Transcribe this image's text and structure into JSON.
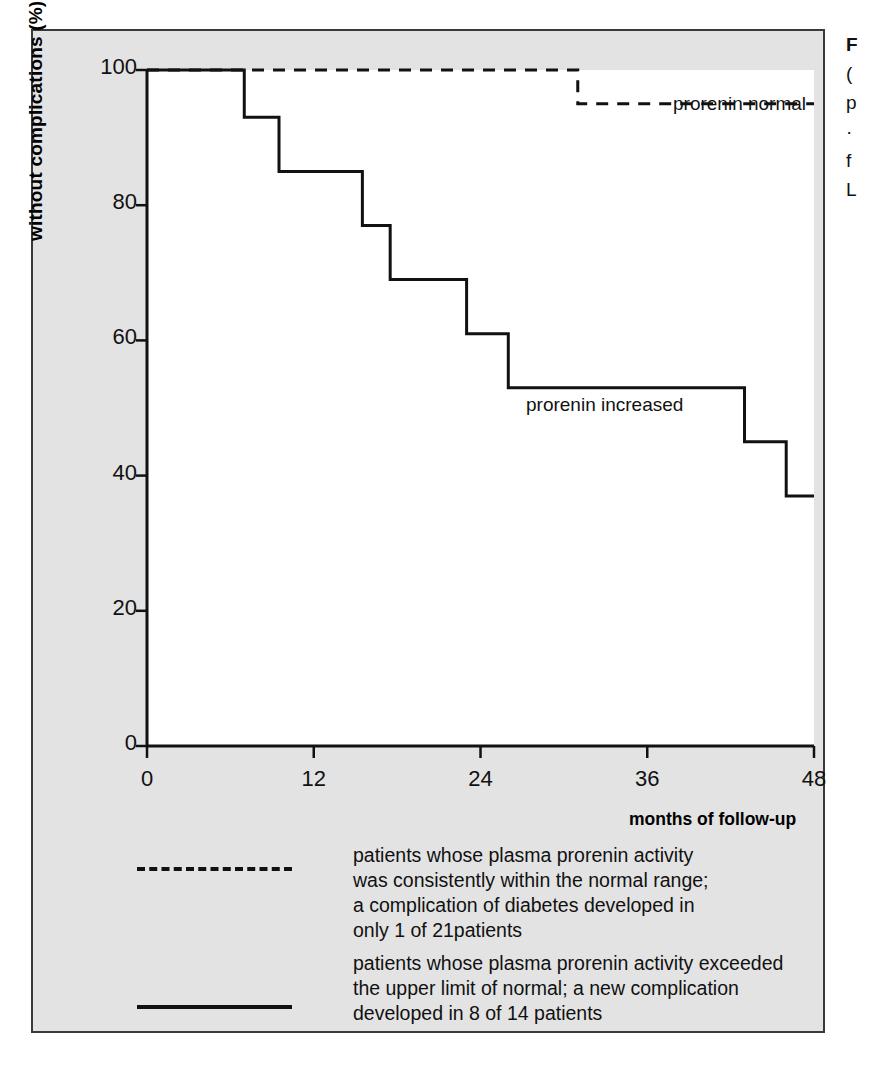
{
  "figure": {
    "background_color": "#e3e3e3",
    "plot_background_color": "#ffffff",
    "border_color": "#3a3a3a",
    "line_color": "#111111"
  },
  "axes": {
    "ylabel": "without complications (%)",
    "yticks": [
      "100",
      "80",
      "60",
      "40",
      "20",
      "0"
    ],
    "ytick_values": [
      100,
      80,
      60,
      40,
      20,
      0
    ],
    "xticks": [
      "0",
      "12",
      "24",
      "36",
      "48"
    ],
    "xtick_values": [
      0,
      12,
      24,
      36,
      48
    ],
    "xlabel": "months of follow-up"
  },
  "series_labels": {
    "normal": "prorenin normal",
    "increased": "prorenin increased"
  },
  "legend": {
    "entries": [
      {
        "style": "dashed",
        "text": "patients whose plasma prorenin activity\nwas consistently within the normal range;\na complication of diabetes developed in\nonly 1 of 21patients"
      },
      {
        "style": "solid",
        "text": "patients whose plasma prorenin activity exceeded\nthe upper limit of normal; a new complication\ndeveloped in 8 of 14 patients"
      }
    ]
  },
  "caption_column": {
    "lines": [
      "F",
      "(",
      "p",
      "·",
      "f",
      "L"
    ]
  },
  "chart_data": {
    "type": "line",
    "title": "",
    "xlabel": "months of follow-up",
    "ylabel": "without complications (%)",
    "xlim": [
      0,
      48
    ],
    "ylim": [
      0,
      100
    ],
    "grid": false,
    "legend_position": "inside-right",
    "step_style": "post",
    "series": [
      {
        "name": "prorenin normal",
        "style": "dashed",
        "x": [
          0,
          31,
          48
        ],
        "y": [
          100,
          100,
          95
        ],
        "steps": [
          {
            "x": 0,
            "y": 100
          },
          {
            "x": 31,
            "y": 100
          },
          {
            "x": 31,
            "y": 95
          },
          {
            "x": 48,
            "y": 95
          }
        ]
      },
      {
        "name": "prorenin increased",
        "style": "solid",
        "x": [
          0,
          7,
          9.5,
          15.5,
          17.5,
          23,
          26,
          43,
          46,
          48
        ],
        "y": [
          100,
          93,
          85,
          77,
          69,
          61,
          53,
          45,
          37,
          37
        ],
        "steps": [
          {
            "x": 0,
            "y": 100
          },
          {
            "x": 7,
            "y": 100
          },
          {
            "x": 7,
            "y": 93
          },
          {
            "x": 9.5,
            "y": 93
          },
          {
            "x": 9.5,
            "y": 85
          },
          {
            "x": 15.5,
            "y": 85
          },
          {
            "x": 15.5,
            "y": 77
          },
          {
            "x": 17.5,
            "y": 77
          },
          {
            "x": 17.5,
            "y": 69
          },
          {
            "x": 23,
            "y": 69
          },
          {
            "x": 23,
            "y": 61
          },
          {
            "x": 26,
            "y": 61
          },
          {
            "x": 26,
            "y": 53
          },
          {
            "x": 43,
            "y": 53
          },
          {
            "x": 43,
            "y": 45
          },
          {
            "x": 46,
            "y": 45
          },
          {
            "x": 46,
            "y": 37
          },
          {
            "x": 48,
            "y": 37
          }
        ]
      }
    ]
  }
}
